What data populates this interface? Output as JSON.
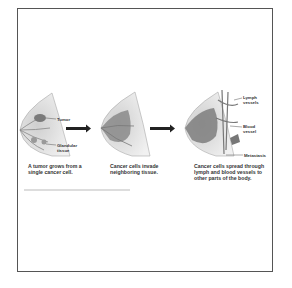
{
  "diagram": {
    "stages": [
      {
        "caption": "A tumor grows from a single cancer cell.",
        "labels": [
          "Tumor",
          "Glandular tissue"
        ]
      },
      {
        "caption": "Cancer cells invade neighboring tissue.",
        "labels": []
      },
      {
        "caption": "Cancer cells spread through lymph and blood vessels to other parts of the body.",
        "labels": [
          "Lymph vessels",
          "Blood vessel",
          "Metastasis"
        ]
      }
    ],
    "label_text": {
      "tumor": "Tumor",
      "glandular_1": "Glandular",
      "glandular_2": "tissue",
      "lymph_1": "Lymph",
      "lymph_2": "vessels",
      "blood_1": "Blood",
      "blood_2": "vessel",
      "metastasis": "Metastasis"
    },
    "captions": {
      "stage1_line1": "A tumor grows from a",
      "stage1_line2": "single cancer cell.",
      "stage2_line1": "Cancer cells invade",
      "stage2_line2": "neighboring tissue.",
      "stage3_line1": "Cancer cells spread through",
      "stage3_line2": "lymph and blood vessels to",
      "stage3_line3": "other parts of the body."
    },
    "arrows": [
      "arrow-1-to-2",
      "arrow-2-to-3"
    ],
    "colors": {
      "border": "#555555",
      "tissue": "#c8c8c8",
      "tumor": "#7a7a7a",
      "arrow": "#222222",
      "text": "#333333"
    }
  }
}
